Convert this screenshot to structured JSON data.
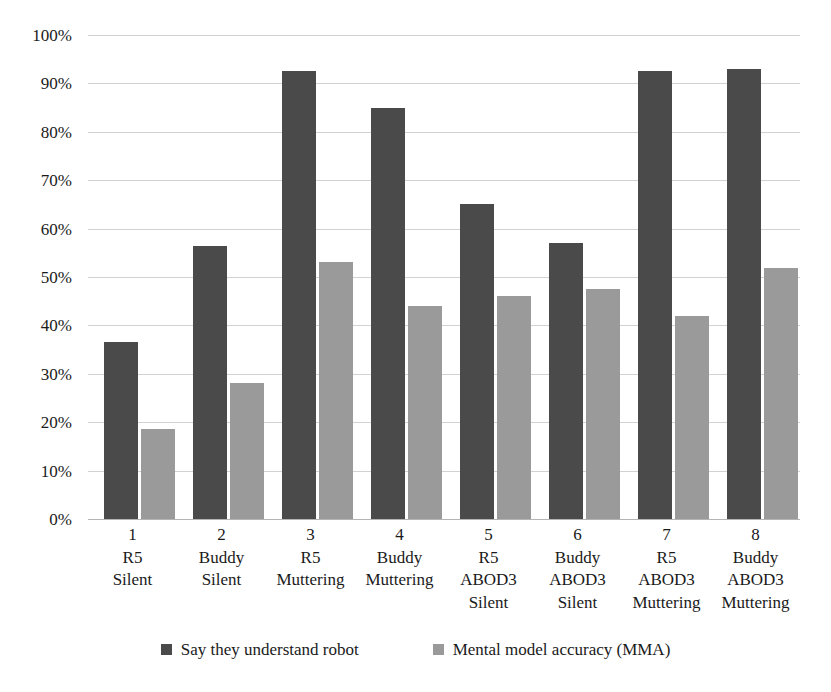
{
  "chart_data": {
    "type": "bar",
    "title": "",
    "subtitle": "",
    "xlabel": "",
    "ylabel": "",
    "ylim": [
      0,
      100
    ],
    "y_unit": "%",
    "grid": true,
    "legend_position": "bottom",
    "orientation": "vertical",
    "grouping": "grouped",
    "yticks": [
      "0%",
      "10%",
      "20%",
      "30%",
      "40%",
      "50%",
      "60%",
      "70%",
      "80%",
      "90%",
      "100%"
    ],
    "ytick_values": [
      0,
      10,
      20,
      30,
      40,
      50,
      60,
      70,
      80,
      90,
      100
    ],
    "categories": [
      "1 R5 Silent",
      "2 Buddy Silent",
      "3 R5 Muttering",
      "4 Buddy Muttering",
      "5 R5 ABOD3 Silent",
      "6 Buddy ABOD3 Silent",
      "7 R5 ABOD3 Muttering",
      "8 Buddy ABOD3 Muttering"
    ],
    "category_label_lines": [
      [
        "1",
        "R5",
        "Silent"
      ],
      [
        "2",
        "Buddy",
        "Silent"
      ],
      [
        "3",
        "R5",
        "Muttering"
      ],
      [
        "4",
        "Buddy",
        "Muttering"
      ],
      [
        "5",
        "R5",
        "ABOD3",
        "Silent"
      ],
      [
        "6",
        "Buddy",
        "ABOD3",
        "Silent"
      ],
      [
        "7",
        "R5",
        "ABOD3",
        "Muttering"
      ],
      [
        "8",
        "Buddy",
        "ABOD3",
        "Muttering"
      ]
    ],
    "series": [
      {
        "name": "Say they understand robot",
        "color": "#4a4a4a",
        "values": [
          36.5,
          56.5,
          92.5,
          85.0,
          65.0,
          57.0,
          92.5,
          93.0
        ]
      },
      {
        "name": "Mental model accuracy (MMA)",
        "color": "#9a9a9a",
        "values": [
          18.5,
          28.0,
          53.0,
          44.0,
          46.0,
          47.5,
          42.0,
          51.8
        ]
      }
    ]
  },
  "legend": {
    "items": [
      {
        "label": "Say they understand robot",
        "color": "#4a4a4a"
      },
      {
        "label": "Mental model accuracy (MMA)",
        "color": "#9a9a9a"
      }
    ]
  },
  "colors": {
    "series_dark": "#4a4a4a",
    "series_light": "#9a9a9a",
    "gridline": "#d2d2d2",
    "background": "#ffffff",
    "text": "#1a1a1a"
  }
}
